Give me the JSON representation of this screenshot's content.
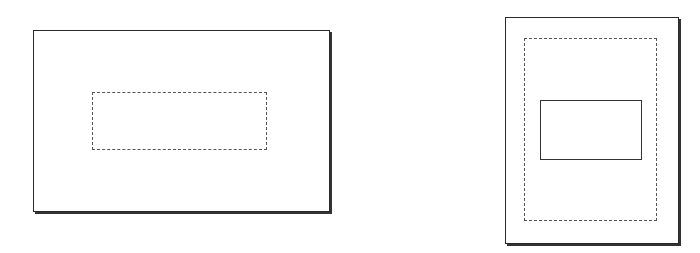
{
  "diagram": {
    "title": "",
    "figures": [
      {
        "name": "landscape-frame",
        "outer": {
          "x": 33,
          "y": 30,
          "w": 297,
          "h": 182,
          "style": "solid-with-shadow"
        },
        "inner": [
          {
            "x": 92,
            "y": 92,
            "w": 175,
            "h": 58,
            "style": "dashed"
          }
        ]
      },
      {
        "name": "portrait-frame",
        "outer": {
          "x": 505,
          "y": 17,
          "w": 174,
          "h": 227,
          "style": "solid-with-shadow"
        },
        "inner": [
          {
            "x": 524,
            "y": 38,
            "w": 133,
            "h": 183,
            "style": "dash-dot"
          },
          {
            "x": 540,
            "y": 100,
            "w": 102,
            "h": 60,
            "style": "solid"
          }
        ]
      }
    ],
    "colors": {
      "line": "#2a2a2a",
      "dashed": "#555555",
      "background": "#ffffff"
    }
  }
}
